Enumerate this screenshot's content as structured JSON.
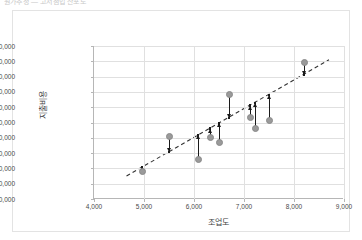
{
  "caption": "원가추정 — 고저점법 산포도",
  "chart_data": {
    "type": "scatter",
    "title": "",
    "xlabel": "조업도",
    "ylabel": "지출비용",
    "xlim": [
      4000,
      9000
    ],
    "ylim": [
      600000,
      1100000
    ],
    "xticks": [
      "4,000",
      "5,000",
      "6,000",
      "7,000",
      "8,000",
      "9,000"
    ],
    "xtick_values": [
      4000,
      5000,
      6000,
      7000,
      8000,
      9000
    ],
    "yticks": [
      "600,000",
      "650,000",
      "700,000",
      "750,000",
      "800,000",
      "850,000",
      "900,000",
      "950,000",
      "1,000,000",
      "1,050,000",
      "1,100,000"
    ],
    "ytick_values": [
      600000,
      650000,
      700000,
      750000,
      800000,
      850000,
      900000,
      950000,
      1000000,
      1050000,
      1100000
    ],
    "grid": true,
    "legend": "none",
    "point_color": "#9a9a9a",
    "trend_color": "#333333",
    "residual_color": "#1a1a1a",
    "series": [
      {
        "name": "지출비용",
        "x": [
          4960,
          5500,
          6080,
          6320,
          6500,
          6700,
          7120,
          7220,
          7500,
          8200
        ],
        "y": [
          690000,
          805000,
          730000,
          800000,
          785000,
          940000,
          865000,
          830000,
          855000,
          1045000
        ]
      }
    ],
    "trendline": {
      "type": "linear",
      "dashed": true,
      "x_start": 4650,
      "y_start": 675000,
      "x_end": 8700,
      "y_end": 1055000,
      "fitted_y": [
        703000,
        753000,
        808000,
        830000,
        847000,
        865000,
        905000,
        914000,
        940000,
        1006000
      ]
    },
    "residual_arrows": [
      {
        "x": 4960,
        "from": 690000,
        "to": 703000,
        "direction": "up"
      },
      {
        "x": 5500,
        "from": 805000,
        "to": 753000,
        "direction": "down"
      },
      {
        "x": 6080,
        "from": 730000,
        "to": 808000,
        "direction": "up"
      },
      {
        "x": 6320,
        "from": 800000,
        "to": 830000,
        "direction": "up"
      },
      {
        "x": 6500,
        "from": 785000,
        "to": 847000,
        "direction": "up"
      },
      {
        "x": 6700,
        "from": 940000,
        "to": 865000,
        "direction": "down"
      },
      {
        "x": 7120,
        "from": 865000,
        "to": 905000,
        "direction": "up"
      },
      {
        "x": 7220,
        "from": 830000,
        "to": 914000,
        "direction": "up"
      },
      {
        "x": 7500,
        "from": 855000,
        "to": 940000,
        "direction": "up"
      },
      {
        "x": 8200,
        "from": 1045000,
        "to": 1006000,
        "direction": "down"
      }
    ]
  }
}
